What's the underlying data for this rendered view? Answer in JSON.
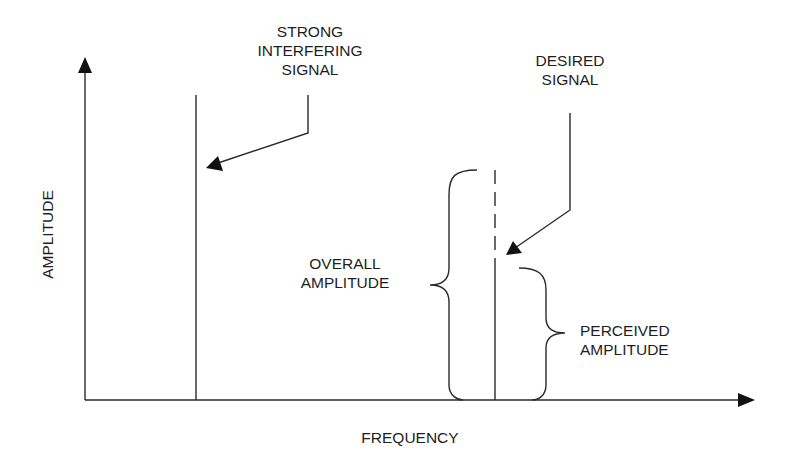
{
  "axes": {
    "y_label": "AMPLITUDE",
    "x_label": "FREQUENCY"
  },
  "labels": {
    "interfering": "STRONG\nINTERFERING\nSIGNAL",
    "desired": "DESIRED\nSIGNAL",
    "overall": "OVERALL\nAMPLITUDE",
    "perceived": "PERCEIVED\nAMPLITUDE"
  },
  "colors": {
    "line": "#2a2a2a",
    "background": "#ffffff"
  }
}
